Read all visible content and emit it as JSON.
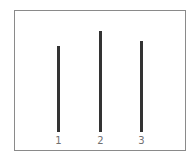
{
  "chart_data": {
    "type": "bar",
    "title": "",
    "xlabel": "",
    "ylabel": "",
    "categories": [
      "1",
      "2",
      "3"
    ],
    "values": [
      86,
      101,
      91
    ],
    "value_scale_note": "relative heights in pixels; no y-axis shown",
    "ylim": [
      0,
      122
    ],
    "grid": false,
    "legend": null,
    "bar_color": "#333333",
    "frame_color": "#8a8a8a"
  },
  "layout": {
    "baseline_y": 132,
    "bar_x": [
      57,
      99,
      140
    ]
  }
}
